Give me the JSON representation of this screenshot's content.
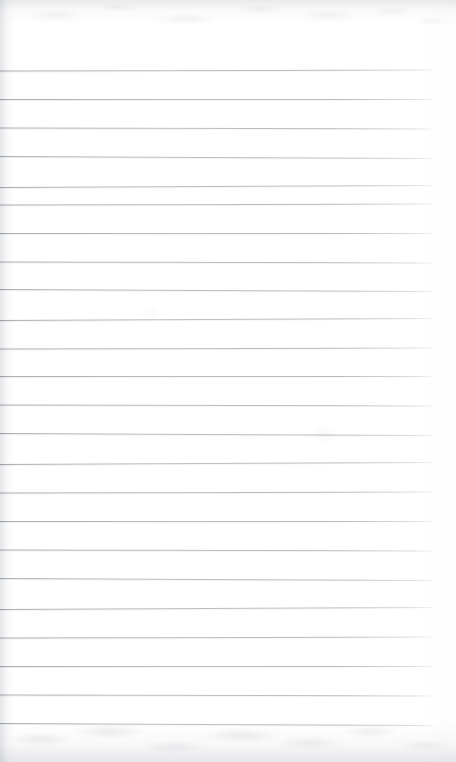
{
  "document": {
    "kind": "scanned-ruled-notebook-page",
    "title": "Blank Lined Notebook Page",
    "written_content": "",
    "page_width": 456,
    "page_height": 762
  },
  "paper": {
    "background_color": "#ffffff",
    "tint_color": "#fbfbfc",
    "left_edge_tint": "#f4f5f6",
    "has_visible_text": false,
    "has_handwriting": false
  },
  "ruling": {
    "line_color": "#a8adb5",
    "line_color_dark_end": "#787e88",
    "line_thickness_px": 1,
    "line_count": 23,
    "spacing_px": 29,
    "first_line_y": 70,
    "last_line_y": 724,
    "line_start_x": 0,
    "line_end_x": 433,
    "top_margin_px": 70,
    "right_margin_px": 23,
    "lines": [
      {
        "index": 1,
        "y": 70,
        "x_start": 0,
        "x_end": 433
      },
      {
        "index": 2,
        "y": 99,
        "x_start": 0,
        "x_end": 433
      },
      {
        "index": 3,
        "y": 128,
        "x_start": 0,
        "x_end": 433
      },
      {
        "index": 4,
        "y": 157,
        "x_start": 0,
        "x_end": 433
      },
      {
        "index": 5,
        "y": 186,
        "x_start": 0,
        "x_end": 433
      },
      {
        "index": 6,
        "y": 204,
        "x_start": 0,
        "x_end": 433
      },
      {
        "index": 7,
        "y": 233,
        "x_start": 0,
        "x_end": 433
      },
      {
        "index": 8,
        "y": 262,
        "x_start": 0,
        "x_end": 433
      },
      {
        "index": 9,
        "y": 290,
        "x_start": 0,
        "x_end": 433
      },
      {
        "index": 10,
        "y": 319,
        "x_start": 0,
        "x_end": 433
      },
      {
        "index": 11,
        "y": 348,
        "x_start": 0,
        "x_end": 433
      },
      {
        "index": 12,
        "y": 376,
        "x_start": 0,
        "x_end": 433
      },
      {
        "index": 13,
        "y": 405,
        "x_start": 0,
        "x_end": 433
      },
      {
        "index": 14,
        "y": 434,
        "x_start": 0,
        "x_end": 433
      },
      {
        "index": 15,
        "y": 463,
        "x_start": 0,
        "x_end": 433
      },
      {
        "index": 16,
        "y": 492,
        "x_start": 0,
        "x_end": 433
      },
      {
        "index": 17,
        "y": 521,
        "x_start": 0,
        "x_end": 433
      },
      {
        "index": 18,
        "y": 550,
        "x_start": 0,
        "x_end": 433
      },
      {
        "index": 19,
        "y": 579,
        "x_start": 0,
        "x_end": 433
      },
      {
        "index": 20,
        "y": 608,
        "x_start": 0,
        "x_end": 433
      },
      {
        "index": 21,
        "y": 637,
        "x_start": 0,
        "x_end": 433
      },
      {
        "index": 22,
        "y": 666,
        "x_start": 0,
        "x_end": 433
      },
      {
        "index": 23,
        "y": 695,
        "x_start": 0,
        "x_end": 433
      },
      {
        "index": 24,
        "y": 724,
        "x_start": 0,
        "x_end": 433
      }
    ]
  },
  "scan_artifacts": {
    "top_edge_noise": true,
    "bottom_edge_noise": true,
    "left_edge_gradient": true,
    "noise_color": "#8e939b"
  }
}
